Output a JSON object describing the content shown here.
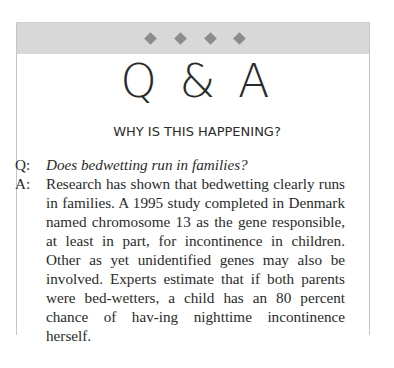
{
  "header": {
    "ornaments": [
      "diamond",
      "diamond",
      "diamond",
      "diamond"
    ],
    "band_color": "#d8d8d8",
    "ornament_color": "#8c8c8c"
  },
  "title": "Q & A",
  "subtitle": "WHY IS THIS HAPPENING?",
  "qa": {
    "question_label": "Q:",
    "question": "Does bedwetting run in families?",
    "answer_label": "A:",
    "answer": "Research has shown that bedwetting clearly runs in families. A 1995 study completed in Denmark named chromosome 13 as the gene responsible, at least in part, for incontinence in children. Other as yet unidentified genes may also be involved. Experts estimate that if both parents were bed-wetters, a child has an 80 percent chance of hav-ing nighttime incontinence herself."
  }
}
